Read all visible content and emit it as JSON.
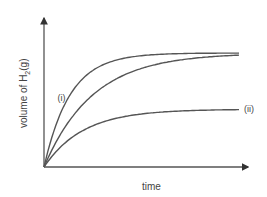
{
  "chart_data": {
    "type": "line",
    "title": "",
    "xlabel": "time",
    "ylabel": "volume of H",
    "ylabel_subscript": "2",
    "ylabel_suffix": "(g)",
    "xlim": [
      0,
      10
    ],
    "ylim": [
      0,
      10
    ],
    "grid": false,
    "series": [
      {
        "name": "(i)",
        "label": "(i)",
        "rate": 0.75,
        "plateau": 7.5,
        "x": [
          0,
          0.5,
          1,
          1.5,
          2,
          2.5,
          3,
          3.5,
          4,
          5,
          6,
          7,
          8,
          9,
          10
        ]
      },
      {
        "name": "unlabeled",
        "label": "",
        "rate": 0.4,
        "plateau": 7.5,
        "x": [
          0,
          0.5,
          1,
          1.5,
          2,
          2.5,
          3,
          3.5,
          4,
          5,
          6,
          7,
          8,
          9,
          10
        ]
      },
      {
        "name": "(ii)",
        "label": "(ii)",
        "rate": 0.5,
        "plateau": 3.8,
        "x": [
          0,
          0.5,
          1,
          1.5,
          2,
          2.5,
          3,
          3.5,
          4,
          5,
          6,
          7,
          8,
          9,
          10
        ]
      }
    ]
  }
}
